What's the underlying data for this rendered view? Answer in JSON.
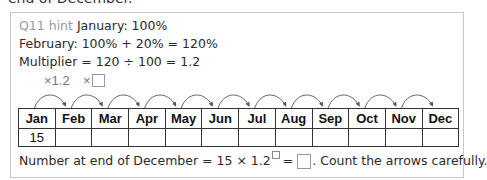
{
  "cut_heading": "end of December.",
  "hint": {
    "label": "Q11 hint",
    "line1": " January: 100%",
    "line2": "February: 100% + 20% = 120%",
    "line3": "Multiplier = 120 ÷ 100 = 1.2"
  },
  "multipliers": {
    "first": "×1.2",
    "second_prefix": "×"
  },
  "table": {
    "months": [
      "Jan",
      "Feb",
      "Mar",
      "Apr",
      "May",
      "Jun",
      "Jul",
      "Aug",
      "Sep",
      "Oct",
      "Nov",
      "Dec"
    ],
    "values": [
      "15",
      "",
      "",
      "",
      "",
      "",
      "",
      "",
      "",
      "",
      "",
      ""
    ]
  },
  "arrows_count": 11,
  "bottom": {
    "prefix": "Number at end of December = 15 × 1.2",
    "equals": " = ",
    "suffix": ". Count the arrows carefully."
  }
}
